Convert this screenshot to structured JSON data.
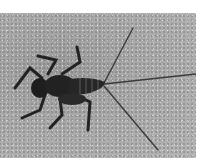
{
  "image": {
    "description": "Grayscale photograph of an aquatic insect nymph (mayfly-like, with three long tail filaments) on a speckled sandy/concrete surface",
    "subject": "insect nymph",
    "background": "speckled gray surface",
    "colors": {
      "border": "#ffffff",
      "surface": "#a8a8a8",
      "insect": "#1e1e1e"
    }
  }
}
